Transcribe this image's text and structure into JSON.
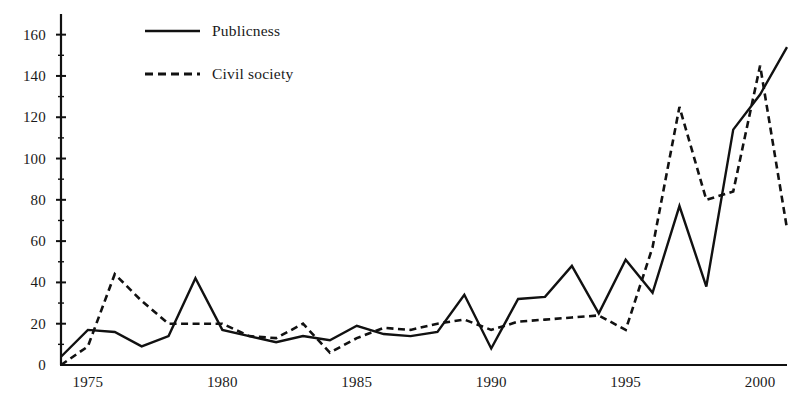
{
  "chart_data": {
    "type": "line",
    "title": "",
    "subtitle": "",
    "xlabel": "",
    "ylabel": "",
    "xlim": [
      1974,
      2001
    ],
    "ylim": [
      0,
      170
    ],
    "grid": false,
    "legend_position": "top-left-inside",
    "x_ticks": [
      1975,
      1980,
      1985,
      1990,
      1995,
      2000
    ],
    "x_tick_labels": [
      "1975",
      "1980",
      "1985",
      "1990",
      "1995",
      "2000"
    ],
    "y_ticks": [
      0,
      20,
      40,
      60,
      80,
      100,
      120,
      140,
      160
    ],
    "y_tick_labels": [
      "0",
      "20",
      "40",
      "60",
      "80",
      "100",
      "120",
      "140",
      "160"
    ],
    "y_minor_ticks": [
      10,
      30,
      50,
      70,
      90,
      110,
      130,
      150
    ],
    "x": [
      1974,
      1975,
      1976,
      1977,
      1978,
      1979,
      1980,
      1981,
      1982,
      1983,
      1984,
      1985,
      1986,
      1987,
      1988,
      1989,
      1990,
      1991,
      1992,
      1993,
      1994,
      1995,
      1996,
      1997,
      1998,
      1999,
      2000,
      2001
    ],
    "series": [
      {
        "name": "Publicness",
        "style": "solid",
        "color": "#111111",
        "values": [
          4,
          17,
          16,
          9,
          14,
          42,
          17,
          14,
          11,
          14,
          12,
          19,
          15,
          14,
          16,
          34,
          8,
          32,
          33,
          48,
          25,
          51,
          35,
          77,
          38,
          114,
          131,
          154
        ]
      },
      {
        "name": "Civil society",
        "style": "dashed",
        "color": "#111111",
        "values": [
          0,
          9,
          44,
          31,
          20,
          20,
          20,
          14,
          13,
          20,
          6,
          13,
          18,
          17,
          20,
          22,
          17,
          21,
          22,
          23,
          24,
          17,
          57,
          125,
          80,
          84,
          145,
          66
        ]
      }
    ]
  },
  "legend": {
    "entries": [
      {
        "label": "Publicness",
        "style": "solid"
      },
      {
        "label": "Civil society",
        "style": "dashed"
      }
    ]
  },
  "axes": {
    "y_axis_name": "y-axis",
    "x_axis_name": "x-axis"
  }
}
